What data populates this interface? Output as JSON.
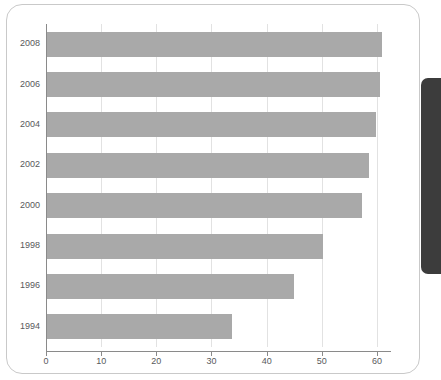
{
  "chart_data": {
    "type": "bar",
    "orientation": "horizontal",
    "title": "",
    "subtitle": "",
    "xlabel": "",
    "ylabel": "",
    "categories": [
      "2008",
      "2006",
      "2004",
      "2002",
      "2000",
      "1998",
      "1996",
      "1994"
    ],
    "values": [
      61.0,
      60.5,
      59.8,
      58.6,
      57.3,
      50.2,
      45.0,
      33.7
    ],
    "series": [
      {
        "name": "",
        "values": [
          61.0,
          60.5,
          59.8,
          58.6,
          57.3,
          50.2,
          45.0,
          33.7
        ]
      }
    ],
    "xlim": [
      0,
      62
    ],
    "ylim": null,
    "xticks": [
      0,
      10,
      20,
      30,
      40,
      50,
      60
    ],
    "xtick_labels": [
      "0",
      "10",
      "20",
      "30",
      "40",
      "50",
      "60"
    ],
    "ytick_labels": [
      "2008",
      "2006",
      "2004",
      "2002",
      "2000",
      "1998",
      "1996",
      "1994"
    ],
    "grid": "vertical",
    "legend": null,
    "legend_position": "none",
    "annotations": [],
    "bar_color": "#a9a9a9",
    "gridline_color": "#e2e2e2",
    "axis_color": "#8a8a8a",
    "label_color": "#58595b",
    "plot_background": "#ffffff"
  },
  "frame": {
    "border_color": "#c9c9c9",
    "background": "#ffffff",
    "edge_strip_color": "#3c3c3c"
  }
}
